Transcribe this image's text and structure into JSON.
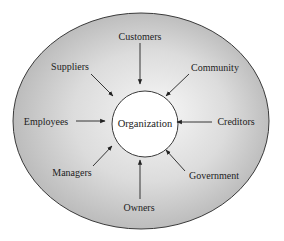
{
  "diagram": {
    "center": {
      "label": "Organization"
    },
    "stakeholders": [
      {
        "id": "customers",
        "label": "Customers"
      },
      {
        "id": "community",
        "label": "Community"
      },
      {
        "id": "creditors",
        "label": "Creditors"
      },
      {
        "id": "government",
        "label": "Government"
      },
      {
        "id": "owners",
        "label": "Owners"
      },
      {
        "id": "managers",
        "label": "Managers"
      },
      {
        "id": "employees",
        "label": "Employees"
      },
      {
        "id": "suppliers",
        "label": "Suppliers"
      }
    ],
    "colors": {
      "outer_center": "#f4f4f4",
      "outer_edge": "#b9b9b9",
      "outline": "#3a3a3a",
      "inner_fill": "#ffffff",
      "text": "#222222"
    }
  }
}
